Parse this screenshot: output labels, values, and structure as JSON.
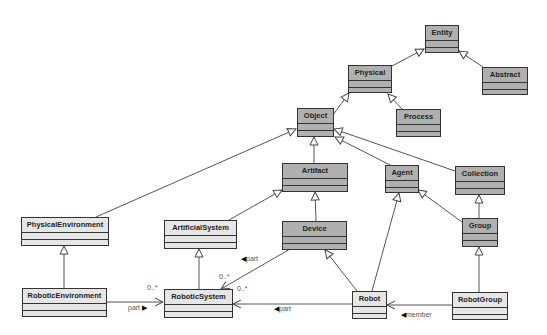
{
  "diagram": {
    "type": "uml-class-diagram",
    "colors": {
      "abstract_class_fill": "#b0b0b0",
      "concrete_class_fill": "#e6e6e6",
      "border": "#333333"
    },
    "classes": {
      "entity": "Entity",
      "physical": "Physical",
      "abstract": "Abstract",
      "process": "Process",
      "object": "Object",
      "artifact": "Artifact",
      "agent": "Agent",
      "collection": "Collection",
      "physical_environment": "PhysicalEnvironment",
      "artificial_system": "ArtificialSystem",
      "device": "Device",
      "group": "Group",
      "robotic_environment": "RoboticEnvironment",
      "robotic_system": "RoboticSystem",
      "robot": "Robot",
      "robot_group": "RobotGroup"
    },
    "generalizations": [
      [
        "Physical",
        "Entity"
      ],
      [
        "Abstract",
        "Entity"
      ],
      [
        "Object",
        "Physical"
      ],
      [
        "Process",
        "Physical"
      ],
      [
        "PhysicalEnvironment",
        "Object"
      ],
      [
        "Artifact",
        "Object"
      ],
      [
        "Agent",
        "Object"
      ],
      [
        "Collection",
        "Object"
      ],
      [
        "ArtificialSystem",
        "Artifact"
      ],
      [
        "Device",
        "Artifact"
      ],
      [
        "Group",
        "Agent"
      ],
      [
        "Group",
        "Collection"
      ],
      [
        "RoboticEnvironment",
        "PhysicalEnvironment"
      ],
      [
        "RoboticSystem",
        "ArtificialSystem"
      ],
      [
        "Robot",
        "Device"
      ],
      [
        "Robot",
        "Agent"
      ],
      [
        "RobotGroup",
        "Group"
      ]
    ],
    "associations": {
      "env_part": {
        "label": "part",
        "multiplicity": "0..*"
      },
      "device_part": {
        "label": "part",
        "multiplicity": "0..*"
      },
      "robot_part": {
        "label": "part",
        "multiplicity": "0..*"
      },
      "member": {
        "label": "member"
      }
    }
  }
}
